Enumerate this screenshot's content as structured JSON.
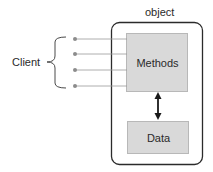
{
  "diagram": {
    "object_label": "object",
    "client_label": "Client",
    "methods_label": "Methods",
    "data_label": "Data",
    "client_connections": 4,
    "relationship": "bidirectional arrow between Methods and Data",
    "colors": {
      "outer_border": "#2b2b2b",
      "inner_box_fill": "#d9d9d9",
      "inner_box_border": "#b8b8b8",
      "connector_line": "#9a9a9a",
      "connector_dot": "#8c8c8c",
      "arrow": "#1a1a1a",
      "text": "#2a2a2a"
    }
  }
}
